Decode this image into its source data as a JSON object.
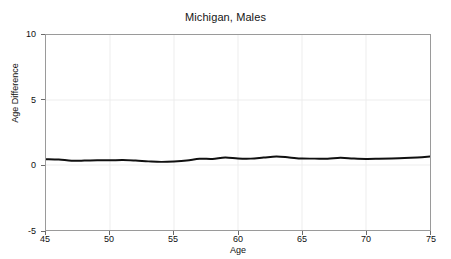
{
  "chart_data": {
    "type": "line",
    "title": "Michigan, Males",
    "xlabel": "Age",
    "ylabel": "Age Difference",
    "xlim": [
      45,
      75
    ],
    "ylim": [
      -5,
      10
    ],
    "xticks": [
      45,
      50,
      55,
      60,
      65,
      70,
      75
    ],
    "yticks": [
      -5,
      0,
      5,
      10
    ],
    "xtick_labels": [
      "45",
      "50",
      "55",
      "60",
      "65",
      "70",
      "75"
    ],
    "ytick_labels": [
      "-5",
      "0",
      "5",
      "10"
    ],
    "grid": true,
    "legend": "none",
    "series": [
      {
        "name": "Age Difference",
        "color": "#101010",
        "line_width": 2,
        "x": [
          45,
          46,
          47,
          48,
          49,
          50,
          51,
          52,
          53,
          54,
          55,
          56,
          57,
          58,
          59,
          60,
          61,
          62,
          63,
          64,
          65,
          66,
          67,
          68,
          69,
          70,
          71,
          72,
          73,
          74,
          75
        ],
        "values": [
          0.45,
          0.42,
          0.33,
          0.34,
          0.37,
          0.36,
          0.38,
          0.34,
          0.28,
          0.24,
          0.27,
          0.34,
          0.48,
          0.47,
          0.58,
          0.5,
          0.49,
          0.57,
          0.65,
          0.58,
          0.5,
          0.49,
          0.48,
          0.55,
          0.5,
          0.47,
          0.48,
          0.5,
          0.53,
          0.58,
          0.65
        ]
      }
    ]
  },
  "axes": {
    "ytick_0": "10",
    "ytick_1": "5",
    "ytick_2": "0",
    "ytick_3": "-5",
    "xtick_0": "45",
    "xtick_1": "50",
    "xtick_2": "55",
    "xtick_3": "60",
    "xtick_4": "65",
    "xtick_5": "70",
    "xtick_6": "75"
  }
}
